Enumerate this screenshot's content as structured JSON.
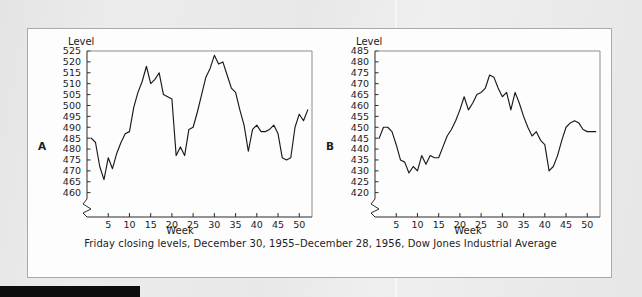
{
  "figure": {
    "caption": "Friday closing levels, December 30, 1955–December 28, 1956, Dow Jones Industrial Average",
    "background_color": "#e9e9e9",
    "card_color": "#fdfdfd",
    "line_color": "#1a1a1a"
  },
  "chart_data": [
    {
      "type": "line",
      "panel_label": "A",
      "title": "",
      "ylabel": "Level",
      "xlabel": "Week",
      "ylim": [
        458,
        525
      ],
      "xlim": [
        0,
        53
      ],
      "yticks": [
        460,
        465,
        470,
        475,
        480,
        485,
        490,
        495,
        500,
        505,
        510,
        515,
        520,
        525
      ],
      "xticks": [
        5,
        10,
        15,
        20,
        25,
        30,
        35,
        40,
        45,
        50
      ],
      "axis_break": true,
      "grid": false,
      "legend": "none",
      "x": [
        1,
        2,
        3,
        4,
        5,
        6,
        7,
        8,
        9,
        10,
        11,
        12,
        13,
        14,
        15,
        16,
        17,
        18,
        19,
        20,
        21,
        22,
        23,
        24,
        25,
        26,
        27,
        28,
        29,
        30,
        31,
        32,
        33,
        34,
        35,
        36,
        37,
        38,
        39,
        40,
        41,
        42,
        43,
        44,
        45,
        46,
        47,
        48,
        49,
        50,
        51,
        52
      ],
      "values": [
        485,
        483,
        472,
        466,
        476,
        471,
        478,
        483,
        487,
        488,
        499,
        506,
        511,
        518,
        510,
        512,
        515,
        505,
        504,
        503,
        477,
        481,
        477,
        489,
        490,
        497,
        505,
        513,
        517,
        523,
        519,
        520,
        514,
        508,
        506,
        498,
        491,
        479,
        489,
        491,
        488,
        488,
        489,
        491,
        487,
        476,
        475,
        476,
        490,
        496,
        493,
        498
      ]
    },
    {
      "type": "line",
      "panel_label": "B",
      "title": "",
      "ylabel": "Level",
      "xlabel": "Week",
      "ylim": [
        418,
        485
      ],
      "xlim": [
        0,
        53
      ],
      "yticks": [
        420,
        425,
        430,
        435,
        440,
        445,
        450,
        455,
        460,
        465,
        470,
        475,
        480,
        485
      ],
      "xticks": [
        5,
        10,
        15,
        20,
        25,
        30,
        35,
        40,
        45,
        50
      ],
      "axis_break": true,
      "grid": false,
      "legend": "none",
      "x": [
        1,
        2,
        3,
        4,
        5,
        6,
        7,
        8,
        9,
        10,
        11,
        12,
        13,
        14,
        15,
        16,
        17,
        18,
        19,
        20,
        21,
        22,
        23,
        24,
        25,
        26,
        27,
        28,
        29,
        30,
        31,
        32,
        33,
        34,
        35,
        36,
        37,
        38,
        39,
        40,
        41,
        42,
        43,
        44,
        45,
        46,
        47,
        48,
        49,
        50,
        51,
        52
      ],
      "values": [
        445,
        450,
        450,
        448,
        442,
        435,
        434,
        429,
        432,
        430,
        437,
        433,
        437,
        436,
        436,
        441,
        446,
        449,
        453,
        458,
        464,
        458,
        461,
        465,
        466,
        468,
        474,
        473,
        468,
        464,
        466,
        458,
        466,
        461,
        455,
        450,
        446,
        448,
        444,
        442,
        430,
        432,
        437,
        444,
        450,
        452,
        453,
        452,
        449,
        448,
        448,
        448
      ]
    }
  ]
}
